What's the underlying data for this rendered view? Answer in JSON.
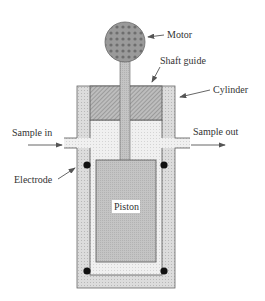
{
  "diagram": {
    "labels": {
      "motor": "Motor",
      "shaft_guide": "Shaft guide",
      "cylinder": "Cylinder",
      "sample_in": "Sample in",
      "sample_out": "Sample out",
      "electrode": "Electrode",
      "piston": "Piston"
    },
    "components": [
      "motor",
      "shaft",
      "shaft-guide",
      "cylinder",
      "inlet-port",
      "outlet-port",
      "electrodes",
      "piston"
    ],
    "electrode_count": 4,
    "colors": {
      "outline": "#555555",
      "motor_fill": "#8a8a8a",
      "cylinder_fill": "#d6d6d6",
      "chamber_fill": "#eeeeee",
      "piston_fill": "#bdbdbd",
      "guide_fill": "#a8a8a8",
      "electrode": "#111111",
      "arrow": "#555555"
    }
  }
}
